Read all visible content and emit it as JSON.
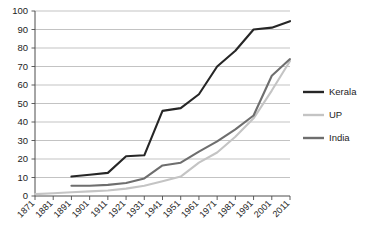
{
  "chart_data": {
    "type": "line",
    "title": "",
    "subtitle": "",
    "xlabel": "",
    "ylabel": "",
    "xlim": [
      1871,
      2011
    ],
    "ylim": [
      0,
      100
    ],
    "grid": true,
    "legend_position": "right",
    "x": [
      1871,
      1881,
      1891,
      1901,
      1911,
      1921,
      1931,
      1941,
      1951,
      1961,
      1971,
      1981,
      1991,
      2001,
      2011
    ],
    "categories": [
      "1871",
      "1881",
      "1891",
      "1901",
      "1911",
      "1921",
      "1931",
      "1941",
      "1951",
      "1961",
      "1971",
      "1981",
      "1991",
      "2001",
      "2011"
    ],
    "ytick_labels": [
      "0",
      "10",
      "20",
      "30",
      "40",
      "50",
      "60",
      "70",
      "80",
      "90",
      "100"
    ],
    "ytick_values": [
      0,
      10,
      20,
      30,
      40,
      50,
      60,
      70,
      80,
      90,
      100
    ],
    "series": [
      {
        "name": "Kerala",
        "color": "#262626",
        "width": 2.1,
        "x": [
          1891,
          1901,
          1911,
          1921,
          1931,
          1941,
          1951,
          1961,
          1971,
          1981,
          1991,
          2001,
          2011
        ],
        "values": [
          10.5,
          11.5,
          12.5,
          21.5,
          22.0,
          46.0,
          47.5,
          55.0,
          70.0,
          78.5,
          90.0,
          91.0,
          94.5
        ]
      },
      {
        "name": "UP",
        "color": "#c4c4c4",
        "width": 2.1,
        "x": [
          1871,
          1881,
          1891,
          1901,
          1911,
          1921,
          1931,
          1941,
          1951,
          1961,
          1971,
          1981,
          1991,
          2001,
          2011
        ],
        "values": [
          1.0,
          1.5,
          2.0,
          2.5,
          3.0,
          4.0,
          5.5,
          8.0,
          10.5,
          18.0,
          23.5,
          32.0,
          42.0,
          57.0,
          73.0
        ]
      },
      {
        "name": "India",
        "color": "#6e6e6e",
        "width": 2.1,
        "x": [
          1891,
          1901,
          1911,
          1921,
          1931,
          1941,
          1951,
          1961,
          1971,
          1981,
          1991,
          2001,
          2011
        ],
        "values": [
          5.5,
          5.5,
          6.0,
          7.0,
          9.5,
          16.5,
          18.0,
          24.0,
          29.5,
          36.0,
          43.5,
          65.0,
          74.0
        ]
      }
    ]
  },
  "legend": {
    "entries": [
      {
        "label": "Kerala",
        "color": "#262626"
      },
      {
        "label": "UP",
        "color": "#c4c4c4"
      },
      {
        "label": "India",
        "color": "#6e6e6e"
      }
    ]
  },
  "plot_geometry": {
    "left": 35,
    "right": 290,
    "top": 11,
    "bottom": 196
  }
}
